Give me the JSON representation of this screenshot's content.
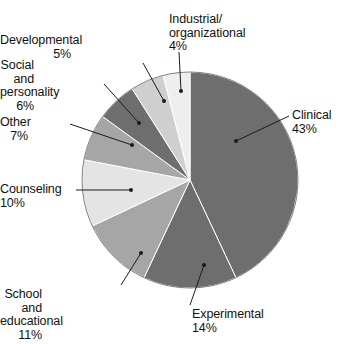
{
  "chart_data": {
    "type": "pie",
    "title": "",
    "xlabel": "",
    "ylabel": "",
    "legend_position": "callout-labels",
    "grid": false,
    "start_angle_deg": 0,
    "direction": "clockwise",
    "categories": [
      "Clinical",
      "Experimental",
      "School and educational",
      "Counseling",
      "Other",
      "Social and personality",
      "Developmental",
      "Industrial/ organizational"
    ],
    "values": [
      43,
      14,
      11,
      10,
      7,
      6,
      5,
      4
    ],
    "unit": "%",
    "slices": [
      {
        "id": "clinical",
        "label": "Clinical",
        "label_lines": "Clinical\n43%",
        "value": 43,
        "value_text": "43%",
        "color": "#6e6e6e",
        "label_side": "right",
        "label_x": 292,
        "label_y": 109,
        "leader": {
          "x1": 289,
          "y1": 116,
          "x2": 236,
          "y2": 141
        }
      },
      {
        "id": "experimental",
        "label": "Experimental",
        "label_lines": "Experimental\n14%",
        "value": 14,
        "value_text": "14%",
        "color": "#6e6e6e",
        "label_side": "center",
        "label_x": 192,
        "label_y": 308,
        "leader": {
          "x1": 190,
          "y1": 305,
          "x2": 204,
          "y2": 265
        }
      },
      {
        "id": "school-and-educational",
        "label": "School and educational",
        "label_lines": "School and\neducational\n11%",
        "value": 11,
        "value_text": "11%",
        "color": "#a6a6a6",
        "label_side": "left",
        "label_x": 42,
        "label_y": 288,
        "leader": {
          "x1": 121,
          "y1": 285,
          "x2": 141,
          "y2": 253
        }
      },
      {
        "id": "counseling",
        "label": "Counseling",
        "label_lines": "Counseling\n10%",
        "value": 10,
        "value_text": "10%",
        "color": "#e4e4e4",
        "label_side": "left",
        "label_x": 5,
        "label_y": 183,
        "leader": {
          "x1": 76,
          "y1": 190,
          "x2": 131,
          "y2": 190
        }
      },
      {
        "id": "other",
        "label": "Other",
        "label_lines": "Other\n7%",
        "value": 7,
        "value_text": "7%",
        "color": "#a6a6a6",
        "label_side": "left",
        "label_x": 28,
        "label_y": 116,
        "leader": {
          "x1": 70,
          "y1": 124,
          "x2": 132,
          "y2": 145
        }
      },
      {
        "id": "social-and-personality",
        "label": "Social and personality",
        "label_lines": "Social and\npersonality\n6%",
        "value": 6,
        "value_text": "6%",
        "color": "#6e6e6e",
        "label_side": "left",
        "label_x": 34,
        "label_y": 59,
        "leader": {
          "x1": 104,
          "y1": 84,
          "x2": 139,
          "y2": 123
        }
      },
      {
        "id": "developmental",
        "label": "Developmental",
        "label_lines": "Developmental\n5%",
        "value": 5,
        "value_text": "5%",
        "color": "#cfcfcf",
        "label_side": "left",
        "label_x": 71,
        "label_y": 34,
        "leader": {
          "x1": 143,
          "y1": 63,
          "x2": 164,
          "y2": 101
        }
      },
      {
        "id": "industrial-organizational",
        "label": "Industrial/ organizational",
        "label_lines": "Industrial/\norganizational\n4%",
        "value": 4,
        "value_text": "4%",
        "color": "#eeeeee",
        "label_side": "center",
        "label_x": 169,
        "label_y": 13,
        "leader": {
          "x1": 179,
          "y1": 52,
          "x2": 181,
          "y2": 91
        }
      }
    ],
    "geometry": {
      "center_x": 190,
      "center_y": 180,
      "radius": 108,
      "outline_color": "#808080",
      "leader_color": "#1a1a1a"
    }
  }
}
